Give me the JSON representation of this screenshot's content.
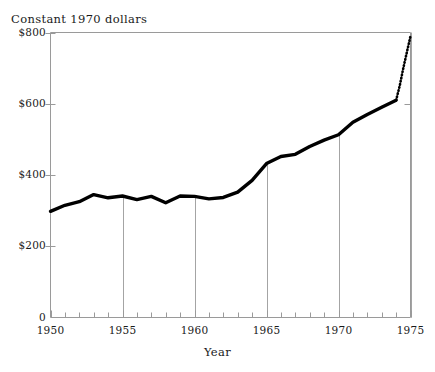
{
  "figure": {
    "background": "#ffffff",
    "ink": "#000000",
    "grid_color": "#9a9a9a"
  },
  "axes": {
    "y_title": "Constant 1970 dollars",
    "x_title": "Year",
    "y_ticks": [
      {
        "value": 0,
        "label": "0"
      },
      {
        "value": 200,
        "label": "$200"
      },
      {
        "value": 400,
        "label": "$400"
      },
      {
        "value": 600,
        "label": "$600"
      },
      {
        "value": 800,
        "label": "$800"
      }
    ],
    "x_ticks": [
      {
        "value": 1950,
        "label": "1950"
      },
      {
        "value": 1955,
        "label": "1955"
      },
      {
        "value": 1960,
        "label": "1960"
      },
      {
        "value": 1965,
        "label": "1965"
      },
      {
        "value": 1970,
        "label": "1970"
      },
      {
        "value": 1975,
        "label": "1975"
      }
    ],
    "x_minor_interval": 1,
    "gridlines_x": [
      1955,
      1960,
      1965,
      1970,
      1975
    ]
  },
  "chart_data": {
    "type": "line",
    "title": "",
    "xlabel": "Year",
    "ylabel": "Constant 1970 dollars",
    "xlim": [
      1950,
      1975
    ],
    "ylim": [
      0,
      800
    ],
    "grid": "vertical-only",
    "legend": "none",
    "series": [
      {
        "name": "Actual (solid)",
        "style": "solid",
        "x": [
          1950,
          1951,
          1952,
          1953,
          1954,
          1955,
          1956,
          1957,
          1958,
          1959,
          1960,
          1961,
          1962,
          1963,
          1964,
          1965,
          1966,
          1967,
          1968,
          1969,
          1970,
          1971,
          1972,
          1973,
          1974
        ],
        "values": [
          298,
          315,
          325,
          345,
          336,
          341,
          331,
          340,
          322,
          341,
          340,
          333,
          337,
          352,
          385,
          432,
          452,
          458,
          480,
          498,
          513,
          548,
          570,
          590,
          610
        ]
      },
      {
        "name": "Projected (dotted)",
        "style": "dotted",
        "x": [
          1974,
          1974.25,
          1974.5,
          1974.75,
          1975
        ],
        "values": [
          610,
          650,
          700,
          745,
          790
        ]
      }
    ],
    "annotations": []
  }
}
